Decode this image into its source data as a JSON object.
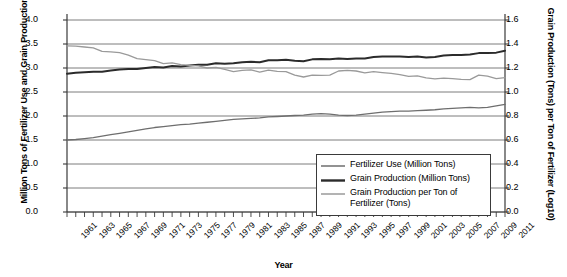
{
  "chart_data": {
    "type": "line",
    "title": "",
    "xlabel": "Year",
    "ylabel": "Million Tons of Fertilizer Use and Grain Production (Log10)",
    "ylabel_right": "Grain Production (Tons) per Ton of Fertilizer (Log10)",
    "xlim": [
      1961,
      2011
    ],
    "ylim": [
      0.0,
      4.0
    ],
    "ylim_right": [
      0.0,
      1.6
    ],
    "yticks": [
      "0.0",
      "0.5",
      "1.0",
      "1.5",
      "2.0",
      "2.5",
      "3.0",
      "3.5",
      "4.0"
    ],
    "yticks_right": [
      "0.0",
      "0.2",
      "0.4",
      "0.6",
      "0.8",
      "1.0",
      "1.2",
      "1.4",
      "1.6"
    ],
    "grid": true,
    "legend_position": "bottom-right",
    "x": [
      1961,
      1962,
      1963,
      1964,
      1965,
      1966,
      1967,
      1968,
      1969,
      1970,
      1971,
      1972,
      1973,
      1974,
      1975,
      1976,
      1977,
      1978,
      1979,
      1980,
      1981,
      1982,
      1983,
      1984,
      1985,
      1986,
      1987,
      1988,
      1989,
      1990,
      1991,
      1992,
      1993,
      1994,
      1995,
      1996,
      1997,
      1998,
      1999,
      2000,
      2001,
      2002,
      2003,
      2004,
      2005,
      2006,
      2007,
      2008,
      2009,
      2010,
      2011
    ],
    "xtick_labels": [
      "1961",
      "1963",
      "1965",
      "1967",
      "1969",
      "1971",
      "1973",
      "1975",
      "1977",
      "1979",
      "1981",
      "1983",
      "1985",
      "1987",
      "1989",
      "1991",
      "1993",
      "1995",
      "1997",
      "1999",
      "2001",
      "2003",
      "2005",
      "2007",
      "2009",
      "2011"
    ],
    "series": [
      {
        "name": "Fertilizer Use (Million Tons)",
        "axis": "left",
        "color": "#6e6e6e",
        "width": 1.3,
        "values": [
          1.5,
          1.51,
          1.53,
          1.55,
          1.58,
          1.61,
          1.64,
          1.67,
          1.7,
          1.73,
          1.76,
          1.78,
          1.8,
          1.82,
          1.83,
          1.85,
          1.87,
          1.89,
          1.91,
          1.93,
          1.94,
          1.95,
          1.96,
          1.98,
          1.99,
          2.0,
          2.01,
          2.02,
          2.04,
          2.05,
          2.04,
          2.02,
          2.01,
          2.02,
          2.04,
          2.06,
          2.08,
          2.09,
          2.1,
          2.1,
          2.11,
          2.12,
          2.13,
          2.15,
          2.16,
          2.17,
          2.18,
          2.17,
          2.18,
          2.21,
          2.24
        ]
      },
      {
        "name": "Grain Production (Million Tons)",
        "axis": "left",
        "color": "#2b2b2b",
        "width": 2.0,
        "values": [
          2.88,
          2.9,
          2.91,
          2.92,
          2.92,
          2.95,
          2.97,
          2.98,
          2.98,
          3.0,
          3.02,
          3.01,
          3.04,
          3.03,
          3.05,
          3.07,
          3.07,
          3.1,
          3.09,
          3.1,
          3.12,
          3.13,
          3.12,
          3.16,
          3.16,
          3.17,
          3.15,
          3.14,
          3.18,
          3.19,
          3.18,
          3.2,
          3.19,
          3.2,
          3.2,
          3.23,
          3.24,
          3.24,
          3.24,
          3.23,
          3.24,
          3.22,
          3.23,
          3.26,
          3.27,
          3.27,
          3.28,
          3.31,
          3.31,
          3.32,
          3.36
        ]
      },
      {
        "name": "Grain Production per Ton of Fertilizer (Tons)",
        "axis": "right",
        "color": "#9a9a9a",
        "width": 1.3,
        "values": [
          1.385,
          1.383,
          1.375,
          1.368,
          1.338,
          1.335,
          1.328,
          1.308,
          1.278,
          1.27,
          1.262,
          1.236,
          1.243,
          1.228,
          1.222,
          1.218,
          1.2,
          1.205,
          1.188,
          1.17,
          1.18,
          1.185,
          1.165,
          1.182,
          1.172,
          1.17,
          1.14,
          1.125,
          1.14,
          1.138,
          1.14,
          1.175,
          1.18,
          1.175,
          1.16,
          1.17,
          1.162,
          1.155,
          1.145,
          1.13,
          1.135,
          1.118,
          1.11,
          1.115,
          1.112,
          1.105,
          1.103,
          1.14,
          1.132,
          1.112,
          1.12
        ]
      }
    ]
  },
  "legend": {
    "items": [
      {
        "label": "Fertilizer Use (Million Tons)"
      },
      {
        "label": "Grain Production (Million Tons)"
      },
      {
        "label": "Grain Production per Ton of Fertilizer (Tons)"
      }
    ],
    "item3_line1": "Grain Production per Ton of",
    "item3_line2": "Fertilizer (Tons)"
  }
}
